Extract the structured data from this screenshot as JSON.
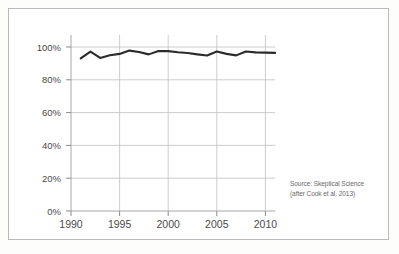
{
  "chart_data": {
    "type": "line",
    "title": "",
    "subtitle": "",
    "xlabel": "",
    "ylabel": "",
    "xlim": [
      1990,
      2011
    ],
    "ylim": [
      0,
      100
    ],
    "grid": true,
    "legend": null,
    "y_tick_labels": [
      "0%",
      "20%",
      "40%",
      "60%",
      "80%",
      "100%"
    ],
    "y_ticks": [
      0,
      20,
      40,
      60,
      80,
      100
    ],
    "x_tick_labels": [
      "1990",
      "1995",
      "2000",
      "2005",
      "2010"
    ],
    "x_ticks": [
      1990,
      1995,
      2000,
      2005,
      2010
    ],
    "x": [
      1991,
      1992,
      1993,
      1994,
      1995,
      1996,
      1997,
      1998,
      1999,
      2000,
      2001,
      2002,
      2003,
      2004,
      2005,
      2006,
      2007,
      2008,
      2009,
      2010,
      2011
    ],
    "series": [
      {
        "name": "Consensus on human-caused global warming",
        "color": "#2b2b2b",
        "values": [
          93.0,
          97.2,
          93.3,
          95.0,
          95.8,
          97.8,
          97.0,
          95.5,
          97.5,
          97.5,
          96.8,
          96.3,
          95.5,
          94.8,
          97.3,
          95.8,
          94.9,
          97.3,
          96.7,
          96.6,
          96.4
        ]
      }
    ],
    "annotations": [
      {
        "id": "source-credit",
        "line1": "Source: Skeptical Science",
        "line2": "(after Cook et al. 2013)"
      }
    ]
  },
  "source": {
    "line1": "Source: Skeptical Science",
    "line2": "(after Cook et al. 2013)"
  },
  "colors": {
    "line": "#2b2b2b",
    "grid": "#bdbdbd",
    "axis": "#8c8c8c",
    "text": "#4a4a4a",
    "source_text": "#6b6b6b",
    "frame": "#b9b9b9",
    "background": "#ffffff"
  }
}
